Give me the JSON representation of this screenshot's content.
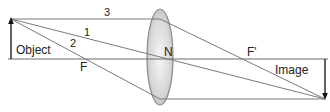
{
  "diagram": {
    "title": "",
    "type": "convex-lens-ray-diagram",
    "labels": {
      "object": "Object",
      "image": "Image",
      "focal_left": "F",
      "focal_right": "F'",
      "center": "N",
      "ray1": "1",
      "ray2": "2",
      "ray3": "3"
    },
    "colors": {
      "ray": "#7a7a7a",
      "axis": "#6a6a6a",
      "arrow": "#111111",
      "lens_edge": "#8a8a8a",
      "lens_fill_light": "#f4f4f4",
      "lens_fill_dark": "#bdbdbd",
      "text": "#222222"
    }
  }
}
